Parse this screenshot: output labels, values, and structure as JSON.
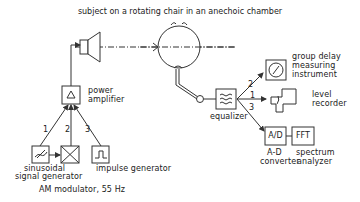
{
  "diagram": {
    "title": "subject on a rotating chair in an anechoic chamber",
    "nodes": {
      "loudspeaker": {
        "label": ""
      },
      "subject_head": {
        "label": ""
      },
      "power_amplifier": {
        "label_line1": "power",
        "label_line2": "amplifier",
        "symbol": "△"
      },
      "sinusoidal_generator": {
        "label_line1": "sinusoidal",
        "label_line2": "signal generator"
      },
      "am_modulator": {
        "label": "AM modulator, 55 Hz"
      },
      "impulse_generator": {
        "label": "impulse generator"
      },
      "microphone_probe": {
        "label": ""
      },
      "equalizer": {
        "label": "equalizer"
      },
      "group_delay": {
        "label_line1": "group delay",
        "label_line2": "measuring",
        "label_line3": "instrument"
      },
      "level_recorder": {
        "label_line1": "level",
        "label_line2": "recorder"
      },
      "ad_converter": {
        "box_text": "A/D",
        "label_line1": "A-D",
        "label_line2": "converter"
      },
      "fft_analyzer": {
        "box_text": "FFT",
        "label_line1": "spectrum",
        "label_line2": "analyzer"
      }
    },
    "input_paths": [
      "1",
      "2",
      "3"
    ],
    "output_paths": [
      "2",
      "1",
      "3"
    ],
    "colors": {
      "line": "#333333",
      "background": "#ffffff"
    }
  }
}
